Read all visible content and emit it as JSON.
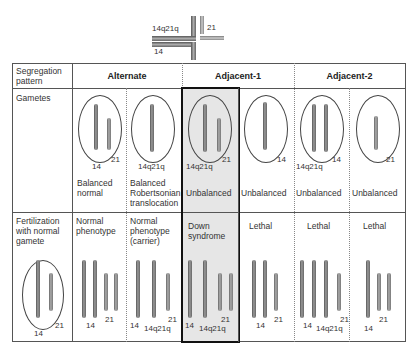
{
  "legend": {
    "fused_label": "14q21q",
    "chr21_label": "21",
    "chr14_label": "14"
  },
  "table": {
    "row_headers": {
      "segregation": "Segregation pattern",
      "gametes": "Gametes",
      "fertilization": "Fertilization with normal gamete"
    },
    "column_groups": [
      "Alternate",
      "Adjacent-1",
      "Adjacent-2"
    ],
    "gametes": [
      {
        "labels": [
          "14",
          "21"
        ],
        "status": "Balanced normal"
      },
      {
        "labels": [
          "14q21q"
        ],
        "status": "Balanced Robertsonian translocation"
      },
      {
        "labels": [
          "14q21q",
          "21"
        ],
        "status": "Unbalanced"
      },
      {
        "labels": [
          "14"
        ],
        "status": "Unbalanced"
      },
      {
        "labels": [
          "14q21q",
          "14"
        ],
        "status": "Unbalanced"
      },
      {
        "labels": [
          "21"
        ],
        "status": "Unbalanced"
      }
    ],
    "normal_gamete": {
      "labels": [
        "14",
        "21"
      ]
    },
    "outcomes": [
      {
        "phenotype": "Normal phenotype",
        "labels": [
          "14",
          "21"
        ]
      },
      {
        "phenotype": "Normal phenotype (carrier)",
        "labels": [
          "14",
          "14q21q",
          "21"
        ]
      },
      {
        "phenotype": "Down syndrome",
        "labels": [
          "14",
          "14q21q",
          "21"
        ]
      },
      {
        "phenotype": "Lethal",
        "labels": [
          "14",
          "21"
        ]
      },
      {
        "phenotype": "Lethal",
        "labels": [
          "14",
          "14q21q",
          "21"
        ]
      },
      {
        "phenotype": "Lethal",
        "labels": [
          "14",
          "21"
        ]
      }
    ],
    "highlight_column": "Adjacent-1 (Down syndrome)",
    "highlight_color": "#e6e6e6"
  }
}
